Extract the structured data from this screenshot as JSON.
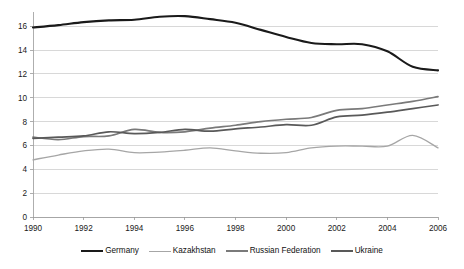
{
  "chart_data": {
    "type": "line",
    "title": "",
    "subtitle": "",
    "xlabel": "",
    "ylabel": "",
    "xlim": [
      1990,
      2006
    ],
    "ylim": [
      0,
      17.2
    ],
    "yticks": [
      0,
      2,
      4,
      6,
      8,
      10,
      12,
      14,
      16
    ],
    "xticks": [
      1990,
      1992,
      1994,
      1996,
      1998,
      2000,
      2002,
      2004,
      2006
    ],
    "xtick_labels": [
      "1990",
      "1992",
      "1994",
      "1996",
      "1998",
      "2000",
      "2002",
      "2004",
      "2006"
    ],
    "ytick_labels": [
      "0",
      "2",
      "4",
      "6",
      "8",
      "10",
      "12",
      "14",
      "16"
    ],
    "grid": true,
    "grid_axis": "y",
    "legend_position": "bottom",
    "x": [
      1990,
      1991,
      1992,
      1993,
      1994,
      1995,
      1996,
      1997,
      1998,
      1999,
      2000,
      2001,
      2002,
      2003,
      2004,
      2005,
      2006
    ],
    "series": [
      {
        "name": "Germany",
        "color": "#1a1a1a",
        "width": 2.1,
        "values": [
          15.9,
          16.1,
          16.35,
          16.5,
          16.55,
          16.8,
          16.85,
          16.6,
          16.3,
          15.7,
          15.1,
          14.6,
          14.5,
          14.5,
          13.9,
          12.6,
          12.3
        ]
      },
      {
        "name": "Kazakhstan",
        "color": "#a6a6a6",
        "width": 1.3,
        "values": [
          4.8,
          5.2,
          5.55,
          5.7,
          5.4,
          5.45,
          5.6,
          5.8,
          5.55,
          5.35,
          5.4,
          5.8,
          5.95,
          5.95,
          5.95,
          6.85,
          5.8
        ]
      },
      {
        "name": "Russian Federation",
        "color": "#7a7a7a",
        "width": 1.7,
        "values": [
          6.7,
          6.5,
          6.75,
          6.8,
          7.35,
          7.1,
          7.15,
          7.45,
          7.7,
          8.0,
          8.2,
          8.35,
          8.95,
          9.1,
          9.4,
          9.7,
          10.1
        ]
      },
      {
        "name": "Ukraine",
        "color": "#595959",
        "width": 1.7,
        "values": [
          6.6,
          6.7,
          6.8,
          7.15,
          7.0,
          7.1,
          7.35,
          7.2,
          7.4,
          7.55,
          7.75,
          7.7,
          8.4,
          8.55,
          8.8,
          9.1,
          9.4
        ]
      }
    ],
    "legend": [
      "Germany",
      "Kazakhstan",
      "Russian Federation",
      "Ukraine"
    ]
  },
  "legend": {
    "items": [
      {
        "label": "Germany"
      },
      {
        "label": "Kazakhstan"
      },
      {
        "label": "Russian Federation"
      },
      {
        "label": "Ukraine"
      }
    ]
  }
}
